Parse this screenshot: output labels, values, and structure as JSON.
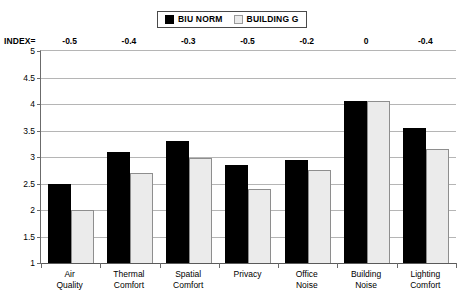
{
  "legend": {
    "entries": [
      {
        "label": "BIU NORM",
        "swatch": "dark-square-icon",
        "color": "#000000"
      },
      {
        "label": "BUILDING G",
        "swatch": "light-square-icon",
        "color": "#ebebeb"
      }
    ]
  },
  "index_row": {
    "label": "INDEX=",
    "values": [
      "-0.5",
      "-0.4",
      "-0.3",
      "-0.5",
      "-0.2",
      "0",
      "-0.4"
    ]
  },
  "axis": {
    "y_ticks": [
      "5",
      "4.5",
      "4",
      "3.5",
      "3",
      "2.5",
      "2",
      "1.5",
      "1"
    ]
  },
  "chart_data": {
    "type": "bar",
    "title": "",
    "xlabel": "",
    "ylabel": "",
    "ylim": [
      1,
      5
    ],
    "ytick_values": [
      1,
      1.5,
      2,
      2.5,
      3,
      3.5,
      4,
      4.5,
      5
    ],
    "grid": true,
    "legend_position": "top-center",
    "categories": [
      "Air Quality",
      "Thermal Comfort",
      "Spatial Comfort",
      "Privacy",
      "Office Noise",
      "Building Noise",
      "Lighting Comfort"
    ],
    "category_lines": [
      [
        "Air",
        "Quality"
      ],
      [
        "Thermal",
        "Comfort"
      ],
      [
        "Spatial",
        "Comfort"
      ],
      [
        "Privacy",
        ""
      ],
      [
        "Office",
        "Noise"
      ],
      [
        "Building",
        "Noise"
      ],
      [
        "Lighting",
        "Comfort"
      ]
    ],
    "series": [
      {
        "name": "BIU NORM",
        "color": "#000000",
        "values": [
          2.5,
          3.1,
          3.3,
          2.85,
          2.95,
          4.05,
          3.55
        ]
      },
      {
        "name": "BUILDING G",
        "color": "#ebebeb",
        "values": [
          2.0,
          2.7,
          2.98,
          2.4,
          2.75,
          4.05,
          3.15
        ]
      }
    ],
    "index_annotations": [
      -0.5,
      -0.4,
      -0.3,
      -0.5,
      -0.2,
      0,
      -0.4
    ]
  }
}
